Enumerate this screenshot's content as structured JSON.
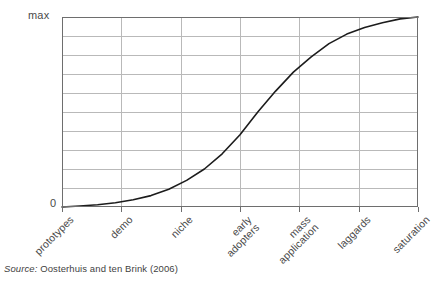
{
  "chart_data": {
    "type": "line",
    "title": "",
    "subtitle": "",
    "xlabel": "",
    "ylabel": "",
    "ylim": [
      0,
      1
    ],
    "ytick_labels": [
      "0",
      "max"
    ],
    "ytick_values": [
      0,
      1
    ],
    "grid": true,
    "grid_horizontal_count": 9,
    "grid_vertical_count": 5,
    "legend": "none",
    "annotations": [],
    "categories": [
      "prototypes",
      "demo",
      "niche",
      "early adopters",
      "mass application",
      "laggards",
      "saturation"
    ],
    "category_labels": [
      {
        "line1": "prototypes",
        "line2": ""
      },
      {
        "line1": "demo",
        "line2": ""
      },
      {
        "line1": "niche",
        "line2": ""
      },
      {
        "line1": "early",
        "line2": "adopters"
      },
      {
        "line1": "mass",
        "line2": "application"
      },
      {
        "line1": "laggards",
        "line2": ""
      },
      {
        "line1": "saturation",
        "line2": ""
      }
    ],
    "series": [
      {
        "name": "adoption",
        "curve": "logistic",
        "values": [
          0.0,
          0.03,
          0.11,
          0.5,
          0.84,
          0.97,
          1.0
        ],
        "points": [
          {
            "x": 0.0,
            "y": 0.0
          },
          {
            "x": 0.05,
            "y": 0.005
          },
          {
            "x": 0.1,
            "y": 0.012
          },
          {
            "x": 0.15,
            "y": 0.022
          },
          {
            "x": 0.2,
            "y": 0.038
          },
          {
            "x": 0.25,
            "y": 0.06
          },
          {
            "x": 0.3,
            "y": 0.093
          },
          {
            "x": 0.35,
            "y": 0.14
          },
          {
            "x": 0.4,
            "y": 0.2
          },
          {
            "x": 0.45,
            "y": 0.28
          },
          {
            "x": 0.5,
            "y": 0.38
          },
          {
            "x": 0.55,
            "y": 0.5
          },
          {
            "x": 0.6,
            "y": 0.61
          },
          {
            "x": 0.65,
            "y": 0.71
          },
          {
            "x": 0.7,
            "y": 0.79
          },
          {
            "x": 0.75,
            "y": 0.86
          },
          {
            "x": 0.8,
            "y": 0.91
          },
          {
            "x": 0.85,
            "y": 0.945
          },
          {
            "x": 0.9,
            "y": 0.97
          },
          {
            "x": 0.95,
            "y": 0.99
          },
          {
            "x": 1.0,
            "y": 1.0
          }
        ]
      }
    ]
  },
  "axis": {
    "y_max_label": "max",
    "y_zero_label": "0"
  },
  "caption": {
    "source_word": "Source:",
    "source_text": " Oosterhuis and ten Brink (2006)"
  },
  "colors": {
    "curve": "#1c1c1c",
    "grid": "#b9b9b9",
    "frame": "#6e6e6e",
    "text": "#3f3f3f",
    "background": "#ffffff"
  }
}
